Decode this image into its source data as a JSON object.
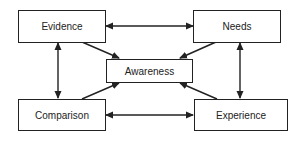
{
  "diagram": {
    "nodes": {
      "evidence": "Evidence",
      "needs": "Needs",
      "awareness": "Awareness",
      "comparison": "Comparison",
      "experience": "Experience"
    },
    "edges": [
      {
        "from": "Evidence",
        "to": "Needs",
        "type": "bidirectional"
      },
      {
        "from": "Comparison",
        "to": "Experience",
        "type": "bidirectional"
      },
      {
        "from": "Evidence",
        "to": "Comparison",
        "type": "bidirectional"
      },
      {
        "from": "Needs",
        "to": "Experience",
        "type": "bidirectional"
      },
      {
        "from": "Evidence",
        "to": "Awareness",
        "type": "directed"
      },
      {
        "from": "Needs",
        "to": "Awareness",
        "type": "directed"
      },
      {
        "from": "Comparison",
        "to": "Awareness",
        "type": "directed"
      },
      {
        "from": "Experience",
        "to": "Awareness",
        "type": "directed"
      }
    ],
    "colors": {
      "line": "#222222",
      "background": "#ffffff"
    }
  }
}
